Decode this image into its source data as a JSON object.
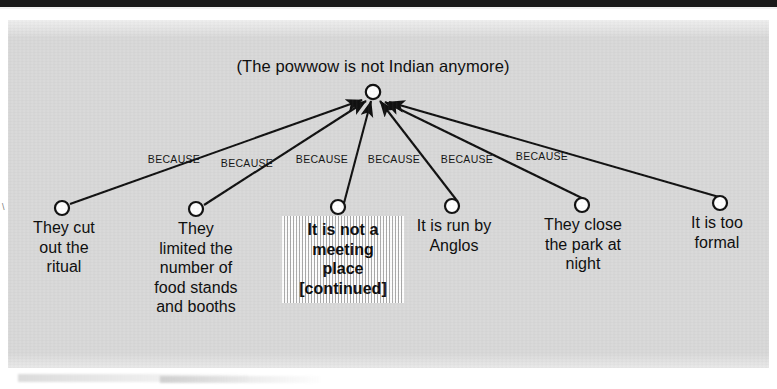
{
  "figure": {
    "kind": "cognitive-map-diagram",
    "root": {
      "label": "(The powwow is not Indian anymore)",
      "node_icon": "circle-node",
      "cx": 365,
      "cy": 72
    },
    "link_label_default": "BECAUSE",
    "links": [
      {
        "label": "BECAUSE",
        "x": 166,
        "y": 133,
        "from_leaf": 0
      },
      {
        "label": "BECAUSE",
        "x": 239,
        "y": 137,
        "from_leaf": 1
      },
      {
        "label": "BECAUSE",
        "x": 314,
        "y": 133,
        "from_leaf": 2
      },
      {
        "label": "BECAUSE",
        "x": 386,
        "y": 133,
        "from_leaf": 3
      },
      {
        "label": "BECAUSE",
        "x": 459,
        "y": 133,
        "from_leaf": 4
      },
      {
        "label": "BECAUSE",
        "x": 534,
        "y": 130,
        "from_leaf": 5
      }
    ],
    "leaves": [
      {
        "text": "They cut\nout the\nritual",
        "node_icon": "circle-node",
        "cx": 54,
        "cy": 188,
        "text_x": 8,
        "text_y": 198,
        "text_w": 96,
        "highlighted": false
      },
      {
        "text": "They\nlimited the\nnumber of\nfood stands\nand booths",
        "node_icon": "circle-node",
        "cx": 188,
        "cy": 189,
        "text_x": 122,
        "text_y": 199,
        "text_w": 132,
        "highlighted": false
      },
      {
        "text": "It is not a\nmeeting\nplace\n[continued]",
        "node_icon": "circle-node",
        "cx": 330,
        "cy": 187,
        "text_x": 274,
        "text_y": 196,
        "text_w": 112,
        "highlighted": true
      },
      {
        "text": "It is run by\nAnglos",
        "node_icon": "circle-node",
        "cx": 444,
        "cy": 186,
        "text_x": 390,
        "text_y": 196,
        "text_w": 112,
        "highlighted": false
      },
      {
        "text": "They close\nthe park at\nnight",
        "node_icon": "circle-node",
        "cx": 574,
        "cy": 185,
        "text_x": 512,
        "text_y": 195,
        "text_w": 126,
        "highlighted": false
      },
      {
        "text": "It is too\nformal",
        "node_icon": "circle-node",
        "cx": 712,
        "cy": 183,
        "text_x": 656,
        "text_y": 193,
        "text_w": 106,
        "highlighted": false
      }
    ],
    "colors": {
      "panel_background": "#d9d9d9",
      "page_background": "#ffffff",
      "ink": "#0d0d0d",
      "node_fill": "#ffffff",
      "top_bar": "#1a1a1a",
      "highlight_stripe": "#787878"
    }
  },
  "margin": {
    "artifact_glyph": "\\"
  }
}
